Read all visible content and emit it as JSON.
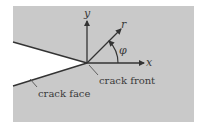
{
  "diagram": {
    "title": "",
    "labels": {
      "y_axis": "y",
      "x_axis": "x",
      "radius": "r",
      "angle": "φ",
      "crack_front": "crack front",
      "crack_face": "crack face"
    },
    "colors": {
      "background": "#c9c9c9",
      "crack_opening": "#ffffff",
      "lines": "#333333",
      "text": "#3a3a3a"
    }
  }
}
